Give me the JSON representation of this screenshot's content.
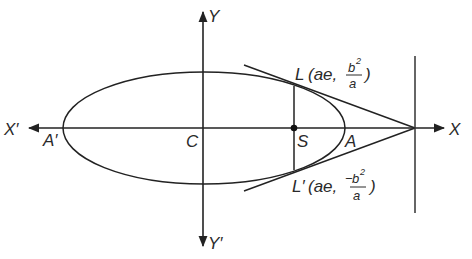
{
  "diagram": {
    "colors": {
      "stroke": "#222222",
      "label": "#2a2a2a",
      "background": "#ffffff"
    },
    "axes": {
      "x_positive_label": "X",
      "x_negative_label": "X′",
      "y_positive_label": "Y",
      "y_negative_label": "Y′"
    },
    "points": {
      "center": "C",
      "focus": "S",
      "vertex_right": "A",
      "vertex_left": "A′"
    },
    "latus_rectum": {
      "upper": {
        "name": "L",
        "coord_prefix": "(ae,",
        "num": "b",
        "exp": "2",
        "den": "a",
        "close": ")"
      },
      "lower": {
        "name": "L′",
        "coord_prefix": "(ae,",
        "sign": "−",
        "num": "b",
        "exp": "2",
        "den": "a",
        "close": ")"
      }
    },
    "elements": [
      "ellipse centered at C",
      "x-axis X′X with arrows",
      "y-axis Y′Y with arrows",
      "focus S on x-axis",
      "latus rectum LL′ through S",
      "tangents at L and L′ meeting on x-axis at directrix",
      "directrix (vertical line)"
    ]
  }
}
